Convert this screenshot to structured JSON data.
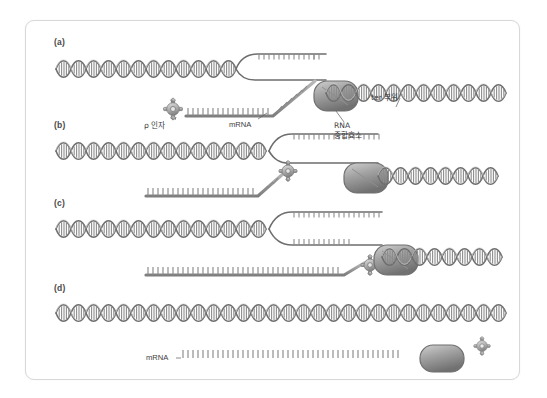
{
  "figure": {
    "background": "#ffffff",
    "frame_color": "#d8d8d8"
  },
  "colors": {
    "dna_light": "#d7d7d7",
    "dna_mid": "#a8a8a8",
    "dna_dark": "#6e6e6e",
    "rna_strand": "#8a8a8a",
    "polymerase_fill": "#9d9d9d",
    "polymerase_dark": "#6f6f6f",
    "rho_fill": "#b4b4b4",
    "text": "#3d3d3d",
    "leader_line": "#5a5a5a"
  },
  "panels": [
    {
      "id": "panel-a",
      "label": "(a)",
      "labels": [
        {
          "name": "rho-factor-label",
          "text": "ρ 인자",
          "x": 118,
          "y": 92
        },
        {
          "name": "mrna-label",
          "text": "mRNA",
          "x": 203,
          "y": 92
        },
        {
          "name": "ter-site-label",
          "text": "ter 부위",
          "x": 345,
          "y": 68
        },
        {
          "name": "rna-polymerase-label",
          "text": "RNA\n중합효소",
          "x": 308,
          "y": 88
        }
      ]
    },
    {
      "id": "panel-b",
      "label": "(b)",
      "labels": []
    },
    {
      "id": "panel-c",
      "label": "(c)",
      "labels": []
    },
    {
      "id": "panel-d",
      "label": "(d)",
      "labels": [
        {
          "name": "mrna-released-label",
          "text": "mRNA",
          "x": 128,
          "y": 330
        }
      ]
    }
  ],
  "legend_terms": {
    "rho_factor": "ρ 인자",
    "mrna": "mRNA",
    "ter_site": "ter 부위",
    "rna_polymerase": "RNA 중합효소"
  }
}
